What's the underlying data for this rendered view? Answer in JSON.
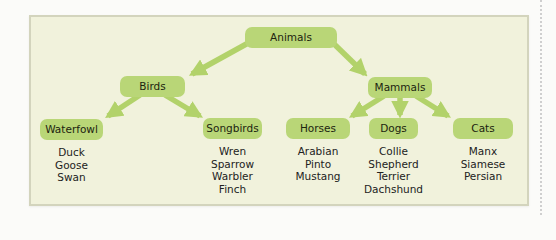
{
  "diagram": {
    "type": "tree",
    "colors": {
      "node_fill": "#b9d677",
      "arrow": "#b2d26a",
      "panel_background": "#f1f2dc",
      "panel_border": "#d3d4bd"
    },
    "root": {
      "label": "Animals"
    },
    "level1": [
      {
        "label": "Birds"
      },
      {
        "label": "Mammals"
      }
    ],
    "level2": [
      {
        "label": "Waterfowl",
        "parent": "Birds",
        "items": [
          "Duck",
          "Goose",
          "Swan"
        ]
      },
      {
        "label": "Songbirds",
        "parent": "Birds",
        "items": [
          "Wren",
          "Sparrow",
          "Warbler",
          "Finch"
        ]
      },
      {
        "label": "Horses",
        "parent": "Mammals",
        "items": [
          "Arabian",
          "Pinto",
          "Mustang"
        ]
      },
      {
        "label": "Dogs",
        "parent": "Mammals",
        "items": [
          "Collie",
          "Shepherd",
          "Terrier",
          "Dachshund"
        ]
      },
      {
        "label": "Cats",
        "parent": "Mammals",
        "items": [
          "Manx",
          "Siamese",
          "Persian"
        ]
      }
    ]
  }
}
